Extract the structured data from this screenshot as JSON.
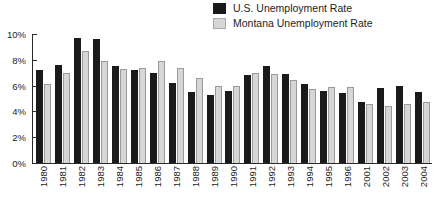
{
  "legend": {
    "position": "top-center-right",
    "items": [
      {
        "label": "U.S. Unemployment Rate",
        "color": "#1a1a1a",
        "swatch": "us-swatch"
      },
      {
        "label": "Montana Unemployment Rate",
        "color": "#d6d6d6",
        "swatch": "montana-swatch"
      }
    ]
  },
  "chart_data": {
    "type": "bar",
    "title": "",
    "subtitle": "",
    "xlabel": "",
    "ylabel": "",
    "ylim": [
      0,
      10
    ],
    "ytick_labels": [
      "0%",
      "2%",
      "4%",
      "6%",
      "8%",
      "10%"
    ],
    "ytick_values": [
      0,
      2,
      4,
      6,
      8,
      10
    ],
    "grid": false,
    "legend_position": "top-right",
    "note": "Years 1997-2000 are not shown on the axis",
    "categories": [
      "1980",
      "1981",
      "1982",
      "1983",
      "1984",
      "1985",
      "1986",
      "1987",
      "1988",
      "1989",
      "1990",
      "1991",
      "1992",
      "1993",
      "1994",
      "1995",
      "1996",
      "2001",
      "2002",
      "2003",
      "2004"
    ],
    "series": [
      {
        "name": "U.S. Unemployment Rate",
        "color": "#1a1a1a",
        "values": [
          7.2,
          7.6,
          9.7,
          9.6,
          7.5,
          7.2,
          7.0,
          6.2,
          5.5,
          5.3,
          5.6,
          6.8,
          7.5,
          6.9,
          6.1,
          5.6,
          5.4,
          4.7,
          5.8,
          6.0,
          5.5
        ]
      },
      {
        "name": "Montana Unemployment Rate",
        "color": "#d6d6d6",
        "values": [
          6.1,
          7.0,
          8.7,
          7.9,
          7.3,
          7.4,
          7.9,
          7.4,
          6.6,
          6.0,
          6.0,
          7.0,
          6.9,
          6.4,
          5.7,
          5.9,
          5.9,
          4.6,
          4.4,
          4.6,
          4.7
        ]
      }
    ]
  }
}
